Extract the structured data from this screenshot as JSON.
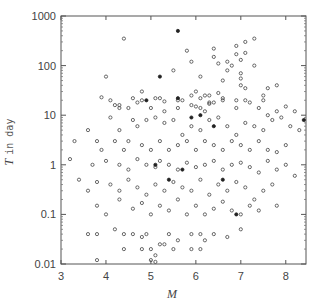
{
  "chart_data": {
    "type": "scatter",
    "title": "",
    "xlabel": "M",
    "ylabel": "T in day",
    "xlim": [
      3.0,
      8.45
    ],
    "ylim": [
      0.01,
      1000
    ],
    "yscale": "log",
    "grid": false,
    "legend": null,
    "marker": "open-circle",
    "x_ticks": [
      3,
      4,
      5,
      6,
      7,
      8
    ],
    "x_tick_labels": [
      "3",
      "4",
      "5",
      "6",
      "7",
      "8"
    ],
    "y_ticks": [
      0.01,
      0.1,
      1,
      10,
      100,
      1000
    ],
    "y_tick_labels": [
      "0.01",
      "0.1",
      "1",
      "10",
      "100",
      "1000"
    ],
    "points": [
      [
        4.4,
        350
      ],
      [
        4.0,
        60
      ],
      [
        3.9,
        23
      ],
      [
        4.8,
        30
      ],
      [
        5.2,
        22
      ],
      [
        5.5,
        80
      ],
      [
        6.1,
        60
      ],
      [
        6.0,
        30
      ],
      [
        5.7,
        20
      ],
      [
        5.3,
        12
      ],
      [
        4.6,
        22
      ],
      [
        4.3,
        14
      ],
      [
        4.2,
        16
      ],
      [
        5.9,
        16
      ],
      [
        6.1,
        14
      ],
      [
        6.2,
        12
      ],
      [
        5.6,
        14
      ],
      [
        6.3,
        18
      ],
      [
        5.0,
        14
      ],
      [
        5.8,
        200
      ],
      [
        5.9,
        120
      ],
      [
        6.4,
        220
      ],
      [
        6.4,
        150
      ],
      [
        6.9,
        250
      ],
      [
        6.9,
        170
      ],
      [
        7.3,
        350
      ],
      [
        7.1,
        300
      ],
      [
        7.1,
        180
      ],
      [
        7.0,
        130
      ],
      [
        6.8,
        100
      ],
      [
        7.0,
        40
      ],
      [
        7.1,
        35
      ],
      [
        7.0,
        55
      ],
      [
        6.7,
        80
      ],
      [
        6.6,
        50
      ],
      [
        7.0,
        70
      ],
      [
        7.1,
        20
      ],
      [
        6.9,
        20
      ],
      [
        6.4,
        18
      ],
      [
        6.3,
        25
      ],
      [
        6.5,
        28
      ],
      [
        6.6,
        22
      ],
      [
        7.3,
        100
      ],
      [
        7.6,
        35
      ],
      [
        7.5,
        25
      ],
      [
        7.5,
        20
      ],
      [
        6.7,
        120
      ],
      [
        6.5,
        110
      ],
      [
        7.8,
        40
      ],
      [
        6.2,
        25
      ],
      [
        4.1,
        20
      ],
      [
        4.3,
        16
      ],
      [
        4.5,
        14
      ],
      [
        4.7,
        18
      ],
      [
        4.8,
        20
      ],
      [
        5.1,
        22
      ],
      [
        5.3,
        19
      ],
      [
        5.6,
        20
      ],
      [
        5.9,
        25
      ],
      [
        6.0,
        15
      ],
      [
        6.1,
        22
      ],
      [
        6.3,
        17
      ],
      [
        6.6,
        20
      ],
      [
        6.9,
        14
      ],
      [
        7.2,
        18
      ],
      [
        7.4,
        14
      ],
      [
        7.6,
        10
      ],
      [
        7.8,
        12
      ],
      [
        8.0,
        15
      ],
      [
        8.2,
        12
      ],
      [
        3.6,
        5
      ],
      [
        4.1,
        9
      ],
      [
        4.3,
        5
      ],
      [
        4.6,
        8
      ],
      [
        4.7,
        6
      ],
      [
        4.9,
        8
      ],
      [
        5.1,
        9
      ],
      [
        5.3,
        7
      ],
      [
        5.5,
        8
      ],
      [
        5.7,
        4
      ],
      [
        5.9,
        6
      ],
      [
        6.1,
        5
      ],
      [
        6.3,
        8
      ],
      [
        6.5,
        9
      ],
      [
        6.7,
        6
      ],
      [
        6.9,
        4
      ],
      [
        7.1,
        7
      ],
      [
        7.3,
        6
      ],
      [
        7.5,
        5
      ],
      [
        7.7,
        8
      ],
      [
        7.9,
        9
      ],
      [
        8.1,
        6
      ],
      [
        8.3,
        5
      ],
      [
        3.3,
        3
      ],
      [
        3.8,
        3
      ],
      [
        3.9,
        2
      ],
      [
        4.2,
        3
      ],
      [
        4.4,
        2
      ],
      [
        4.5,
        3
      ],
      [
        4.8,
        2.5
      ],
      [
        5.0,
        2
      ],
      [
        5.2,
        3
      ],
      [
        5.4,
        2
      ],
      [
        5.6,
        2.5
      ],
      [
        5.8,
        3
      ],
      [
        6.0,
        2
      ],
      [
        6.2,
        3
      ],
      [
        6.4,
        2.5
      ],
      [
        6.6,
        2
      ],
      [
        6.8,
        3
      ],
      [
        7.0,
        2.5
      ],
      [
        7.2,
        2
      ],
      [
        7.4,
        3
      ],
      [
        7.6,
        2
      ],
      [
        7.8,
        1.8
      ],
      [
        8.0,
        2.5
      ],
      [
        3.2,
        1.3
      ],
      [
        3.7,
        1
      ],
      [
        4.0,
        1.2
      ],
      [
        4.3,
        1
      ],
      [
        4.5,
        0.8
      ],
      [
        4.7,
        1.3
      ],
      [
        4.9,
        1
      ],
      [
        5.1,
        0.9
      ],
      [
        5.2,
        1.2
      ],
      [
        5.4,
        1
      ],
      [
        5.6,
        0.8
      ],
      [
        5.8,
        1.1
      ],
      [
        6.0,
        0.9
      ],
      [
        6.2,
        1
      ],
      [
        6.4,
        1.2
      ],
      [
        6.6,
        0.8
      ],
      [
        6.8,
        1
      ],
      [
        7.0,
        1.1
      ],
      [
        7.2,
        0.9
      ],
      [
        7.4,
        0.7
      ],
      [
        7.6,
        1.2
      ],
      [
        7.8,
        0.8
      ],
      [
        8.0,
        1
      ],
      [
        8.2,
        0.6
      ],
      [
        3.4,
        0.5
      ],
      [
        3.6,
        0.3
      ],
      [
        3.8,
        0.45
      ],
      [
        4.1,
        0.4
      ],
      [
        4.3,
        0.3
      ],
      [
        4.5,
        0.5
      ],
      [
        4.7,
        0.35
      ],
      [
        4.9,
        0.25
      ],
      [
        5.1,
        0.4
      ],
      [
        5.3,
        0.3
      ],
      [
        5.5,
        0.45
      ],
      [
        5.7,
        0.35
      ],
      [
        5.9,
        0.3
      ],
      [
        6.1,
        0.5
      ],
      [
        6.3,
        0.25
      ],
      [
        6.5,
        0.4
      ],
      [
        6.7,
        0.3
      ],
      [
        6.9,
        0.45
      ],
      [
        7.1,
        0.35
      ],
      [
        7.3,
        0.2
      ],
      [
        7.5,
        0.3
      ],
      [
        7.7,
        0.4
      ],
      [
        3.8,
        0.15
      ],
      [
        4.0,
        0.1
      ],
      [
        4.3,
        0.2
      ],
      [
        4.6,
        0.13
      ],
      [
        4.8,
        0.17
      ],
      [
        5.0,
        0.1
      ],
      [
        5.2,
        0.15
      ],
      [
        5.4,
        0.12
      ],
      [
        5.6,
        0.2
      ],
      [
        5.8,
        0.1
      ],
      [
        6.0,
        0.15
      ],
      [
        6.2,
        0.1
      ],
      [
        6.4,
        0.13
      ],
      [
        6.6,
        0.18
      ],
      [
        6.8,
        0.12
      ],
      [
        7.0,
        0.1
      ],
      [
        7.2,
        0.15
      ],
      [
        7.4,
        0.12
      ],
      [
        7.8,
        0.15
      ],
      [
        3.6,
        0.04
      ],
      [
        3.8,
        0.04
      ],
      [
        4.2,
        0.05
      ],
      [
        4.4,
        0.04
      ],
      [
        4.6,
        0.04
      ],
      [
        4.8,
        0.035
      ],
      [
        4.9,
        0.04
      ],
      [
        5.0,
        0.02
      ],
      [
        5.2,
        0.025
      ],
      [
        5.4,
        0.04
      ],
      [
        5.6,
        0.03
      ],
      [
        5.9,
        0.04
      ],
      [
        6.1,
        0.04
      ],
      [
        6.2,
        0.03
      ],
      [
        6.4,
        0.04
      ],
      [
        6.7,
        0.035
      ],
      [
        7.0,
        0.05
      ],
      [
        4.4,
        0.02
      ],
      [
        4.8,
        0.02
      ],
      [
        5.1,
        0.015
      ],
      [
        5.3,
        0.025
      ],
      [
        5.5,
        0.02
      ],
      [
        5.9,
        0.02
      ],
      [
        6.1,
        0.02
      ],
      [
        3.8,
        0.012
      ],
      [
        5.0,
        0.012
      ],
      [
        5.1,
        0.011
      ]
    ],
    "filled_points": [
      [
        5.6,
        500
      ],
      [
        5.2,
        60
      ],
      [
        4.9,
        20
      ],
      [
        5.6,
        22
      ],
      [
        6.1,
        10
      ],
      [
        5.9,
        9
      ],
      [
        6.4,
        6
      ],
      [
        5.1,
        1
      ],
      [
        5.7,
        0.8
      ],
      [
        6.6,
        0.5
      ],
      [
        5.4,
        0.5
      ],
      [
        6.9,
        0.1
      ],
      [
        8.4,
        8
      ]
    ]
  },
  "axes": {
    "x_label": "M",
    "y_label_italic": "T",
    "y_label_rest": "in day"
  }
}
